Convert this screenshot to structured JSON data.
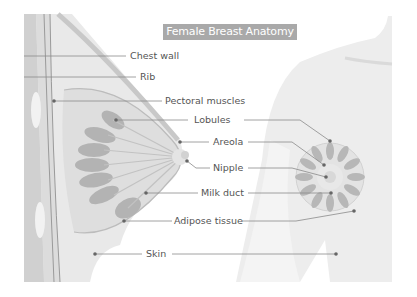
{
  "title": "Female Breast Anatomy",
  "colors": {
    "title_bg": "#a9a9a9",
    "title_text": "#ffffff",
    "label_text": "#555555",
    "leader_line": "#8a8a8a",
    "leader_dot": "#666666",
    "tissue_light": "#e6e6e6",
    "tissue_mid": "#d4d4d4",
    "lobule": "#b5b5b5",
    "body_silhouette": "#ececec"
  },
  "left_labels": [
    {
      "id": "chest-wall",
      "text": "Chest wall"
    },
    {
      "id": "rib",
      "text": "Rib"
    },
    {
      "id": "pectoral-muscles",
      "text": "Pectoral muscles"
    }
  ],
  "center_labels": [
    {
      "id": "lobules",
      "text": "Lobules"
    },
    {
      "id": "areola",
      "text": "Areola"
    },
    {
      "id": "nipple",
      "text": "Nipple"
    },
    {
      "id": "milk-duct",
      "text": "Milk duct"
    },
    {
      "id": "adipose-tissue",
      "text": "Adipose tissue"
    },
    {
      "id": "skin",
      "text": "Skin"
    }
  ]
}
